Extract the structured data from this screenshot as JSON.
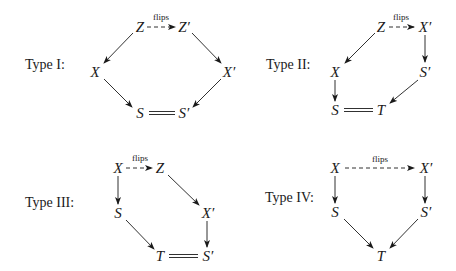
{
  "diagrams": {
    "type1": {
      "label": "Type I:",
      "nodes": {
        "top_left": "Z",
        "top_right": "Z′",
        "mid_left": "X",
        "mid_right": "X′",
        "bot_left": "S",
        "bot_right": "S′"
      },
      "edge_label": "flips"
    },
    "type2": {
      "label": "Type II:",
      "nodes": {
        "top_left": "Z",
        "top_right": "X′",
        "mid_left": "X",
        "mid_right": "S′",
        "bot_left": "S",
        "bot_right": "T"
      },
      "edge_label": "flips"
    },
    "type3": {
      "label": "Type III:",
      "nodes": {
        "top_left": "X",
        "top_right": "Z",
        "mid_left": "S",
        "mid_right": "X′",
        "bot_left": "T",
        "bot_right": "S′"
      },
      "edge_label": "flips"
    },
    "type4": {
      "label": "Type IV:",
      "nodes": {
        "top_left": "X",
        "top_right": "X′",
        "mid_left": "S",
        "mid_right": "S′",
        "bot": "T"
      },
      "edge_label": "flips"
    }
  },
  "colors": {
    "ink": "#1a1a1a",
    "background": "#ffffff"
  }
}
